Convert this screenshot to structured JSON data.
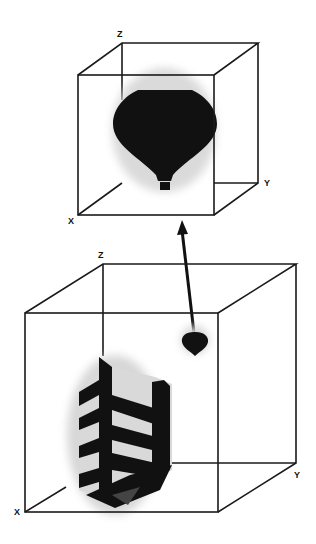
{
  "diagram": {
    "top_cube": {
      "axis_labels": {
        "z": "Z",
        "y": "Y",
        "x": "X"
      },
      "content": "hot-air-balloon (enlarged)"
    },
    "bottom_cube": {
      "axis_labels": {
        "z": "Z",
        "y": "Y",
        "x": "X"
      },
      "content": [
        "building",
        "small balloon"
      ]
    },
    "connector": "double-headed arrow linking small balloon to enlarged balloon view",
    "colors": {
      "line": "#1a1a1a",
      "fill": "#111111",
      "halo": "#cfcfcf",
      "building_face": "#d9d9d9"
    }
  }
}
